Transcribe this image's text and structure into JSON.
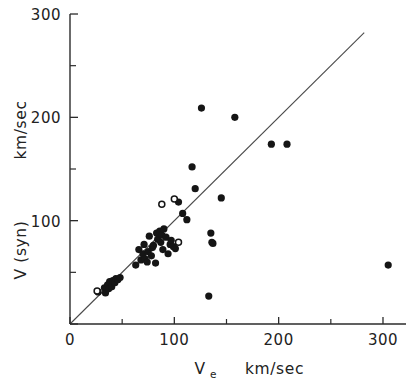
{
  "chart_data": {
    "type": "scatter",
    "title": "",
    "xlabel": "Ve   km/sec",
    "xlabel_main": "V",
    "xlabel_sub": "e",
    "xlabel_units": "km/sec",
    "ylabel": "V (syn)   km/sec",
    "ylabel_main": "V (syn)",
    "ylabel_units": "km/sec",
    "xlim": [
      0,
      320
    ],
    "ylim": [
      0,
      300
    ],
    "xticks": [
      0,
      100,
      200,
      300
    ],
    "xticklabels": [
      "0",
      "100",
      "200",
      "300"
    ],
    "xticks_minor": [
      50,
      150,
      250
    ],
    "yticks": [
      0,
      100,
      200,
      300
    ],
    "yticklabels": [
      "",
      "100",
      "200",
      "300"
    ],
    "yticks_minor": [
      50,
      150,
      250
    ],
    "grid": false,
    "legend": "none",
    "annotations": [
      {
        "kind": "reference-line",
        "label": "identity line y = x",
        "from": [
          0,
          0
        ],
        "to": [
          282,
          282
        ]
      }
    ],
    "series": [
      {
        "name": "filled",
        "marker": "filled-circle",
        "color": "#151515",
        "points": [
          [
            27,
            31
          ],
          [
            33,
            35
          ],
          [
            34,
            30
          ],
          [
            36,
            38
          ],
          [
            37,
            34
          ],
          [
            38,
            41
          ],
          [
            40,
            36
          ],
          [
            41,
            42
          ],
          [
            43,
            40
          ],
          [
            44,
            44
          ],
          [
            46,
            43
          ],
          [
            48,
            45
          ],
          [
            63,
            57
          ],
          [
            66,
            72
          ],
          [
            68,
            62
          ],
          [
            70,
            68
          ],
          [
            71,
            77
          ],
          [
            72,
            63
          ],
          [
            74,
            60
          ],
          [
            75,
            70
          ],
          [
            76,
            85
          ],
          [
            78,
            66
          ],
          [
            79,
            74
          ],
          [
            80,
            76
          ],
          [
            82,
            59
          ],
          [
            83,
            88
          ],
          [
            84,
            82
          ],
          [
            86,
            90
          ],
          [
            87,
            79
          ],
          [
            88,
            86
          ],
          [
            89,
            72
          ],
          [
            90,
            92
          ],
          [
            92,
            84
          ],
          [
            94,
            68
          ],
          [
            96,
            77
          ],
          [
            97,
            81
          ],
          [
            99,
            75
          ],
          [
            101,
            73
          ],
          [
            104,
            118
          ],
          [
            108,
            107
          ],
          [
            112,
            101
          ],
          [
            117,
            152
          ],
          [
            120,
            131
          ],
          [
            126,
            209
          ],
          [
            133,
            27
          ],
          [
            135,
            88
          ],
          [
            136,
            79
          ],
          [
            137,
            78
          ],
          [
            145,
            122
          ],
          [
            158,
            200
          ],
          [
            193,
            174
          ],
          [
            208,
            174
          ],
          [
            305,
            57
          ]
        ]
      },
      {
        "name": "open",
        "marker": "open-circle",
        "color": "#151515",
        "points": [
          [
            26,
            32
          ],
          [
            88,
            116
          ],
          [
            100,
            121
          ],
          [
            104,
            79
          ]
        ]
      }
    ]
  },
  "axes": {
    "x_axis_name": "x-axis",
    "y_axis_name": "y-axis"
  }
}
